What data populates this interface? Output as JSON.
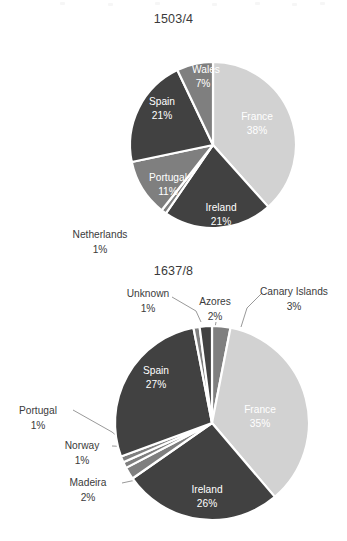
{
  "figure": {
    "background": "#ffffff",
    "palette": {
      "light_gray": "#d2d2d2",
      "medium_gray": "#7f7f7f",
      "dark_gray": "#414141",
      "label_text": "#3b3b3b",
      "inside_text": "#ffffff",
      "leader_line": "#8d8d8d",
      "slice_border": "#ffffff"
    }
  },
  "chart_data": [
    {
      "type": "pie",
      "id": "chart-1503-4",
      "title": "1503/4",
      "xlabel": "",
      "ylabel": "",
      "legend": "none",
      "grid": false,
      "label_format": "name + percent",
      "start_angle_deg": 0,
      "direction": "clockwise",
      "center": {
        "cx": 213,
        "cy": 145,
        "r": 83
      },
      "categories": [
        "France",
        "Ireland",
        "Netherlands",
        "Portugal",
        "Spain",
        "Wales"
      ],
      "values": [
        38,
        21,
        1,
        11,
        21,
        7
      ],
      "unit": "%",
      "slices": [
        {
          "name": "France",
          "value": 38,
          "label": "France",
          "pct": "38%",
          "color": "#d2d2d2",
          "placement": "inside",
          "label_x": 257,
          "label_y": 117,
          "pct_x": 257,
          "pct_y": 131
        },
        {
          "name": "Ireland",
          "value": 21,
          "label": "Ireland",
          "pct": "21%",
          "color": "#414141",
          "placement": "inside",
          "label_x": 221,
          "label_y": 208,
          "pct_x": 221,
          "pct_y": 222
        },
        {
          "name": "Netherlands",
          "value": 1,
          "label": "Netherlands",
          "pct": "1%",
          "color": "#7f7f7f",
          "placement": "outside",
          "label_x": 100,
          "label_y": 235,
          "pct_x": 100,
          "pct_y": 250
        },
        {
          "name": "Portugal",
          "value": 11,
          "label": "Portugal",
          "pct": "11%",
          "color": "#7f7f7f",
          "placement": "inside",
          "label_x": 168,
          "label_y": 178,
          "pct_x": 168,
          "pct_y": 192
        },
        {
          "name": "Spain",
          "value": 21,
          "label": "Spain",
          "pct": "21%",
          "color": "#414141",
          "placement": "inside",
          "label_x": 162,
          "label_y": 102,
          "pct_x": 162,
          "pct_y": 116
        },
        {
          "name": "Wales",
          "value": 7,
          "label": "Wales",
          "pct": "7%",
          "color": "#7f7f7f",
          "placement": "inside",
          "label_x": 206,
          "label_y": 70,
          "pct_x": 203,
          "pct_y": 84
        }
      ]
    },
    {
      "type": "pie",
      "id": "chart-1637-8",
      "title": "1637/8",
      "xlabel": "",
      "ylabel": "",
      "legend": "none",
      "grid": false,
      "label_format": "name + percent",
      "start_angle_deg": 0,
      "direction": "clockwise",
      "center": {
        "cx": 212,
        "cy": 423,
        "r": 97
      },
      "categories": [
        "Canary Islands",
        "France",
        "Ireland",
        "Madeira",
        "Norway",
        "Portugal",
        "Spain",
        "Unknown",
        "Azores"
      ],
      "values": [
        3,
        35,
        26,
        2,
        1,
        1,
        27,
        1,
        2
      ],
      "unit": "%",
      "slices": [
        {
          "name": "Canary Islands",
          "value": 3,
          "label": "Canary Islands",
          "pct": "3%",
          "color": "#7f7f7f",
          "placement": "outside",
          "label_x": 294,
          "label_y": 292,
          "pct_x": 294,
          "pct_y": 307
        },
        {
          "name": "France",
          "value": 35,
          "label": "France",
          "pct": "35%",
          "color": "#d2d2d2",
          "placement": "inside",
          "label_x": 260,
          "label_y": 410,
          "pct_x": 260,
          "pct_y": 424
        },
        {
          "name": "Ireland",
          "value": 26,
          "label": "Ireland",
          "pct": "26%",
          "color": "#414141",
          "placement": "inside",
          "label_x": 207,
          "label_y": 490,
          "pct_x": 207,
          "pct_y": 504
        },
        {
          "name": "Madeira",
          "value": 2,
          "label": "Madeira",
          "pct": "2%",
          "color": "#7f7f7f",
          "placement": "outside",
          "label_x": 88,
          "label_y": 483,
          "pct_x": 88,
          "pct_y": 498
        },
        {
          "name": "Norway",
          "value": 1,
          "label": "Norway",
          "pct": "1%",
          "color": "#7f7f7f",
          "placement": "outside",
          "label_x": 82,
          "label_y": 446,
          "pct_x": 82,
          "pct_y": 461
        },
        {
          "name": "Portugal",
          "value": 1,
          "label": "Portugal",
          "pct": "1%",
          "color": "#7f7f7f",
          "placement": "outside",
          "label_x": 38,
          "label_y": 411,
          "pct_x": 38,
          "pct_y": 426
        },
        {
          "name": "Spain",
          "value": 27,
          "label": "Spain",
          "pct": "27%",
          "color": "#414141",
          "placement": "inside",
          "label_x": 156,
          "label_y": 371,
          "pct_x": 156,
          "pct_y": 385
        },
        {
          "name": "Unknown",
          "value": 1,
          "label": "Unknown",
          "pct": "1%",
          "color": "#7f7f7f",
          "placement": "outside",
          "label_x": 148,
          "label_y": 294,
          "pct_x": 148,
          "pct_y": 309
        },
        {
          "name": "Azores",
          "value": 2,
          "label": "Azores",
          "pct": "2%",
          "color": "#414141",
          "placement": "outside",
          "label_x": 215,
          "label_y": 302,
          "pct_x": 215,
          "pct_y": 317
        }
      ],
      "leaders": [
        {
          "for": "Unknown",
          "points": "172,297 196,311 201,322"
        },
        {
          "for": "Azores",
          "points": "216,322 214,333"
        },
        {
          "for": "Canary Islands",
          "points": "262,293 247,308 241,327"
        },
        {
          "for": "Portugal",
          "points": "73,410 112,432 123,441"
        },
        {
          "for": "Norway",
          "points": "112,446 136,447 140,452"
        },
        {
          "for": "Madeira",
          "points": "122,483 136,480 141,472"
        }
      ]
    }
  ]
}
